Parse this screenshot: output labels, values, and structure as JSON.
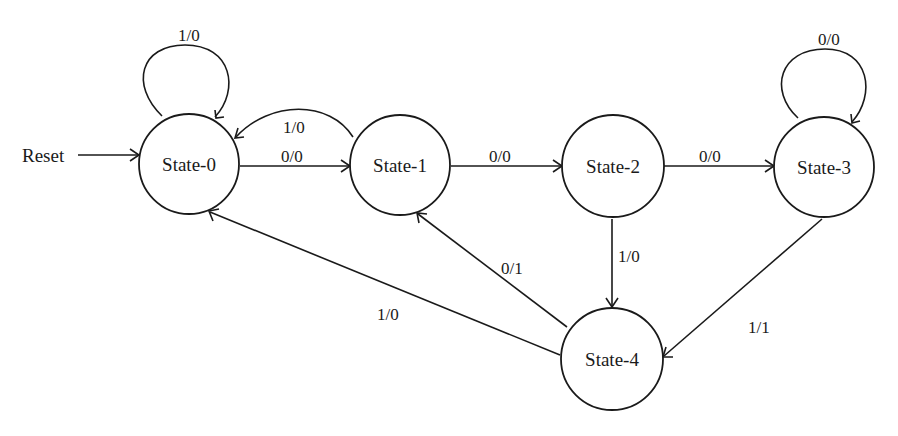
{
  "diagram": {
    "type": "state-machine",
    "reset_label": "Reset",
    "states": [
      {
        "id": "s0",
        "label": "State-0"
      },
      {
        "id": "s1",
        "label": "State-1"
      },
      {
        "id": "s2",
        "label": "State-2"
      },
      {
        "id": "s3",
        "label": "State-3"
      },
      {
        "id": "s4",
        "label": "State-4"
      }
    ],
    "transitions": [
      {
        "from": "State-0",
        "to": "State-0",
        "label": "1/0"
      },
      {
        "from": "State-0",
        "to": "State-1",
        "label": "0/0"
      },
      {
        "from": "State-1",
        "to": "State-0",
        "label": "1/0"
      },
      {
        "from": "State-1",
        "to": "State-2",
        "label": "0/0"
      },
      {
        "from": "State-2",
        "to": "State-3",
        "label": "0/0"
      },
      {
        "from": "State-2",
        "to": "State-4",
        "label": "1/0"
      },
      {
        "from": "State-3",
        "to": "State-3",
        "label": "0/0"
      },
      {
        "from": "State-3",
        "to": "State-4",
        "label": "1/1"
      },
      {
        "from": "State-4",
        "to": "State-1",
        "label": "0/1"
      },
      {
        "from": "State-4",
        "to": "State-0",
        "label": "1/0"
      }
    ]
  }
}
